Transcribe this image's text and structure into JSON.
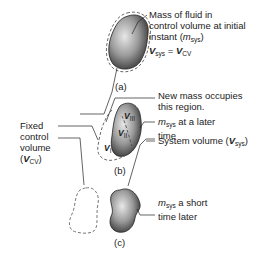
{
  "figure": {
    "panels": [
      {
        "id": "a",
        "caption": "(a)"
      },
      {
        "id": "b",
        "caption": "(b)"
      },
      {
        "id": "c",
        "caption": "(c)"
      }
    ],
    "labels": {
      "mass_initial": {
        "line1": "Mass of fluid in",
        "line2": "control volume at initial",
        "line3_prefix": "instant (",
        "line3_m": "m",
        "line3_sub": "sys",
        "line3_suffix": ")",
        "eq_lhs_sym": "V",
        "eq_lhs_sub": "sys",
        "eq_mid": " = ",
        "eq_rhs_sym": "V",
        "eq_rhs_sub": "CV"
      },
      "new_mass": {
        "line1": "New mass occupies",
        "line2": "this region."
      },
      "later": {
        "m": "m",
        "sub": "sys",
        "line1_suffix": " at a later",
        "line2": "time"
      },
      "system_volume": {
        "prefix": "System volume (",
        "sym": "V",
        "sub": "sys",
        "suffix": ")"
      },
      "fixed_cv": {
        "line1": "Fixed",
        "line2": "control",
        "line3": "volume",
        "line4_prefix": "(",
        "line4_sym": "V",
        "line4_sub": "CV",
        "line4_suffix": ")"
      },
      "short_later": {
        "m": "m",
        "sub": "sys",
        "line1_suffix": " a short",
        "line2": "time later"
      },
      "region_I": {
        "sym": "V",
        "sub": "I"
      },
      "region_II": {
        "sym": "V",
        "sub": "II"
      },
      "region_III": {
        "sym": "V",
        "sub": "III"
      }
    }
  }
}
